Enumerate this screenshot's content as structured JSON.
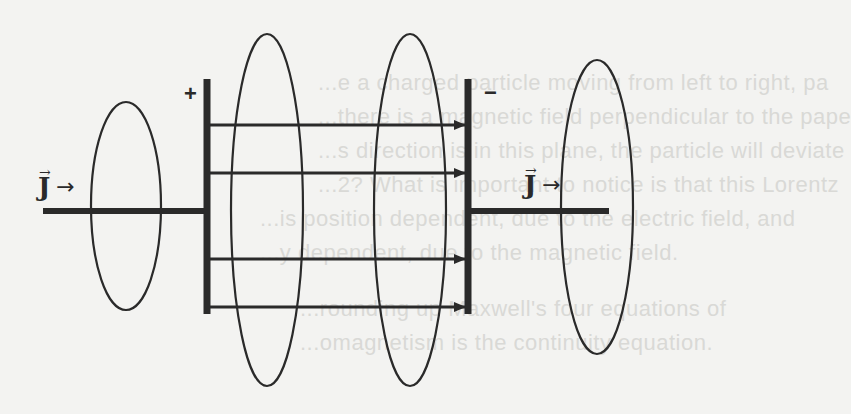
{
  "diagram": {
    "plates": {
      "left": {
        "sign": "+",
        "x": 207,
        "y_top": 79,
        "y_bottom": 314
      },
      "right": {
        "sign": "−",
        "x": 468,
        "y_top": 79,
        "y_bottom": 314
      }
    },
    "wires": {
      "left": {
        "x1": 43,
        "x2": 207,
        "y": 211
      },
      "right": {
        "x1": 468,
        "x2": 609,
        "y": 211
      }
    },
    "field_arrows_y": [
      125,
      173,
      259,
      307
    ],
    "loops": [
      {
        "cx": 126,
        "cy": 206,
        "rx": 35,
        "ry": 104
      },
      {
        "cx": 267,
        "cy": 210,
        "rx": 36,
        "ry": 176
      },
      {
        "cx": 410,
        "cy": 210,
        "rx": 36,
        "ry": 176
      },
      {
        "cx": 597,
        "cy": 207,
        "rx": 36,
        "ry": 147
      }
    ],
    "current_labels": [
      {
        "symbol": "J",
        "vector_mark": "→",
        "direction_arrow": "→"
      },
      {
        "symbol": "J",
        "vector_mark": "→",
        "direction_arrow": "→"
      }
    ],
    "colors": {
      "ink": "#2a2a2a",
      "background": "#f3f3f1",
      "bleed_text": "#d9d9d6"
    }
  },
  "bleed_through_text": [
    "...e a charged particle moving from left to right, pa",
    "...there is a magnetic field perpendicular to the pape",
    "...s direction is in this plane, the particle will deviate",
    "...2? What is important to notice is that this Lorentz",
    "...is position dependent, due to the electric field, and",
    "...y dependent, due to the magnetic field.",
    "...rounding up Maxwell's four equations of",
    "...omagnetism is the continuity equation."
  ]
}
